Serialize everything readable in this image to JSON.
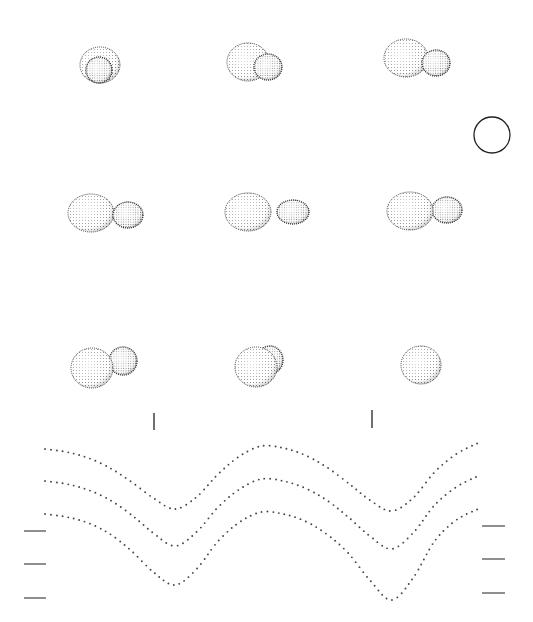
{
  "figure": {
    "background": "#ffffff",
    "ink": "#222222",
    "dot_color": "#444444"
  },
  "binary_panels": [
    {
      "row": 0,
      "col": 0,
      "cx": 100,
      "cy": 65,
      "phase_label": "",
      "primary": {
        "dx": 0,
        "rx": 20,
        "ry": 18
      },
      "secondary": {
        "dx": -1,
        "dy": 5,
        "rx": 13,
        "ry": 13,
        "in_front": true
      }
    },
    {
      "row": 0,
      "col": 1,
      "cx": 248,
      "cy": 62,
      "phase_label": "",
      "primary": {
        "dx": 0,
        "rx": 21,
        "ry": 19
      },
      "secondary": {
        "dx": 20,
        "dy": 5,
        "rx": 14,
        "ry": 13,
        "in_front": true
      }
    },
    {
      "row": 0,
      "col": 2,
      "cx": 406,
      "cy": 58,
      "phase_label": "",
      "primary": {
        "dx": 0,
        "rx": 22,
        "ry": 19
      },
      "secondary": {
        "dx": 30,
        "dy": 5,
        "rx": 14,
        "ry": 13,
        "in_front": true
      }
    },
    {
      "row": 1,
      "col": 0,
      "cx": 91,
      "cy": 213,
      "phase_label": "",
      "primary": {
        "dx": 0,
        "rx": 23,
        "ry": 19
      },
      "secondary": {
        "dx": 37,
        "dy": 2,
        "rx": 15,
        "ry": 13,
        "in_front": true
      }
    },
    {
      "row": 1,
      "col": 1,
      "cx": 248,
      "cy": 212,
      "phase_label": "",
      "primary": {
        "dx": 0,
        "rx": 23,
        "ry": 19
      },
      "secondary": {
        "dx": 45,
        "dy": 0,
        "rx": 16,
        "ry": 12,
        "in_front": true
      }
    },
    {
      "row": 1,
      "col": 2,
      "cx": 410,
      "cy": 211,
      "phase_label": "",
      "primary": {
        "dx": 0,
        "rx": 23,
        "ry": 19
      },
      "secondary": {
        "dx": 37,
        "dy": -1,
        "rx": 15,
        "ry": 13,
        "in_front": false
      }
    },
    {
      "row": 2,
      "col": 0,
      "cx": 92,
      "cy": 368,
      "phase_label": "",
      "primary": {
        "dx": 0,
        "rx": 21,
        "ry": 20
      },
      "secondary": {
        "dx": 31,
        "dy": -7,
        "rx": 14,
        "ry": 14,
        "in_front": false
      }
    },
    {
      "row": 2,
      "col": 1,
      "cx": 256,
      "cy": 367,
      "phase_label": "",
      "primary": {
        "dx": 0,
        "rx": 21,
        "ry": 20
      },
      "secondary": {
        "dx": 14,
        "dy": -7,
        "rx": 13,
        "ry": 14,
        "in_front": false
      }
    },
    {
      "row": 2,
      "col": 2,
      "cx": 421,
      "cy": 365,
      "phase_label": "",
      "primary": {
        "dx": 0,
        "rx": 20,
        "ry": 19
      },
      "secondary": null
    }
  ],
  "reference_circle": {
    "cx": 492,
    "cy": 135,
    "r": 18
  },
  "chart_data": {
    "type": "line",
    "title": "",
    "xlabel": "",
    "ylabel": "",
    "style": "dotted",
    "x": [
      0.0,
      0.05,
      0.1,
      0.15,
      0.2,
      0.25,
      0.3,
      0.35,
      0.4,
      0.45,
      0.5,
      0.55,
      0.6,
      0.65,
      0.7,
      0.75,
      0.8,
      0.85,
      0.9,
      0.95,
      1.0
    ],
    "x_pixel_range": [
      45,
      478
    ],
    "series": [
      {
        "name": "curve-1",
        "y_pixel": [
          449,
          452,
          458,
          468,
          482,
          498,
          509,
          497,
          474,
          456,
          446,
          448,
          455,
          467,
          483,
          500,
          511,
          498,
          472,
          454,
          443
        ]
      },
      {
        "name": "curve-2",
        "y_pixel": [
          481,
          484,
          490,
          500,
          515,
          533,
          546,
          532,
          507,
          489,
          479,
          481,
          488,
          500,
          517,
          536,
          549,
          533,
          505,
          487,
          476
        ]
      },
      {
        "name": "curve-3",
        "y_pixel": [
          514,
          517,
          523,
          534,
          551,
          572,
          585,
          569,
          541,
          522,
          512,
          514,
          521,
          534,
          553,
          580,
          600,
          578,
          541,
          520,
          509
        ]
      }
    ],
    "phase_ticks": [
      {
        "x": 154,
        "y1": 413,
        "y2": 430
      },
      {
        "x": 372,
        "y1": 410,
        "y2": 428
      }
    ],
    "left_reference_bars": [
      {
        "x1": 24,
        "x2": 46,
        "y": 531
      },
      {
        "x1": 24,
        "x2": 46,
        "y": 564
      },
      {
        "x1": 24,
        "x2": 46,
        "y": 598
      }
    ],
    "right_reference_bars": [
      {
        "x1": 482,
        "x2": 505,
        "y": 526
      },
      {
        "x1": 482,
        "x2": 505,
        "y": 559
      },
      {
        "x1": 482,
        "x2": 505,
        "y": 593
      }
    ],
    "grid": false,
    "legend": "none"
  }
}
